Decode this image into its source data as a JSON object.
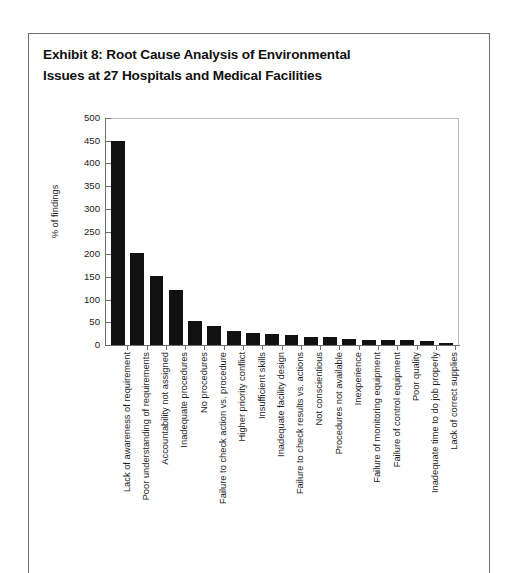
{
  "exhibit": {
    "title_line1": "Exhibit 8: Root Cause Analysis of Environmental",
    "title_line2": "Issues at 27 Hospitals and Medical Facilities"
  },
  "chart_data": {
    "type": "bar",
    "title": "Exhibit 8: Root Cause Analysis of Environmental Issues at 27 Hospitals and Medical Facilities",
    "xlabel": "",
    "ylabel": "% of findings",
    "ylim": [
      0,
      500
    ],
    "yticks": [
      0,
      50,
      100,
      150,
      200,
      250,
      300,
      350,
      400,
      450,
      500
    ],
    "ytick_labels": [
      "0",
      "50",
      "100",
      "150",
      "200",
      "250",
      "300",
      "350",
      "400",
      "450",
      "500"
    ],
    "grid": false,
    "legend": null,
    "bar_color": "#111111",
    "categories": [
      "Lack of awareness of requirement",
      "Poor understanding of requirements",
      "Accountability not assigned",
      "Inadequate procedures",
      "No procedures",
      "Failure to check action vs. procedure",
      "Higher priority conflict",
      "Insufficient skills",
      "Inadequate facility design",
      "Failure to check results vs. actions",
      "Not conscientious",
      "Procedures not available",
      "Inexperience",
      "Failure of monitoring equipment",
      "Failure of control equipment",
      "Poor quality",
      "Inadequate time to do job properly",
      "Lack of correct supplies"
    ],
    "values": [
      450,
      202,
      152,
      122,
      52,
      42,
      30,
      26,
      24,
      22,
      18,
      17,
      14,
      12,
      11,
      10,
      8,
      4
    ]
  }
}
